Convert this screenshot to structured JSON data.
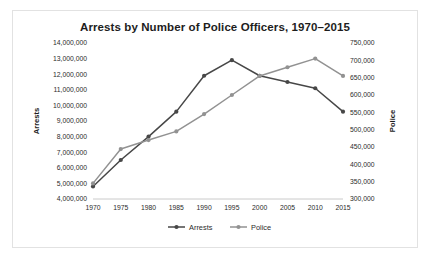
{
  "chart_data": {
    "type": "line",
    "title": "Arrests by Number of Police Officers, 1970–2015",
    "xlabel": "",
    "ylabel": "Arrests",
    "y2label": "Police",
    "x": [
      1970,
      1975,
      1980,
      1985,
      1990,
      1995,
      2000,
      2005,
      2010,
      2015
    ],
    "categories": [
      "1970",
      "1975",
      "1980",
      "1985",
      "1990",
      "1995",
      "2000",
      "2005",
      "2010",
      "2015"
    ],
    "ylim": [
      4000000,
      14000000
    ],
    "yticks": [
      4000000,
      5000000,
      6000000,
      7000000,
      8000000,
      9000000,
      10000000,
      11000000,
      12000000,
      13000000,
      14000000
    ],
    "ytick_labels": [
      "4,000,000",
      "5,000,000",
      "6,000,000",
      "7,000,000",
      "8,000,000",
      "9,000,000",
      "10,000,000",
      "11,000,000",
      "12,000,000",
      "13,000,000",
      "14,000,000"
    ],
    "y2lim": [
      300000,
      750000
    ],
    "y2ticks": [
      300000,
      350000,
      400000,
      450000,
      500000,
      550000,
      600000,
      650000,
      700000,
      750000
    ],
    "y2tick_labels": [
      "300,000",
      "350,000",
      "400,000",
      "450,000",
      "500,000",
      "550,000",
      "600,000",
      "650,000",
      "700,000",
      "750,000"
    ],
    "grid": false,
    "legend_position": "bottom",
    "series": [
      {
        "name": "Arrests",
        "axis": "left",
        "color": "#474747",
        "values": [
          4800000,
          6500000,
          8000000,
          9600000,
          11900000,
          12900000,
          11900000,
          11500000,
          11100000,
          9600000
        ]
      },
      {
        "name": "Police",
        "axis": "right",
        "color": "#929292",
        "values": [
          345000,
          444000,
          470000,
          495000,
          545000,
          600000,
          655000,
          680000,
          705000,
          655000
        ]
      }
    ]
  },
  "legend": {
    "items": [
      {
        "label": "Arrests",
        "color": "#474747"
      },
      {
        "label": "Police",
        "color": "#929292"
      }
    ]
  }
}
